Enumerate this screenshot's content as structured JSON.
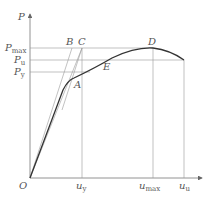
{
  "diagram": {
    "type": "load-displacement curve",
    "axes": {
      "y_label": "P",
      "x_origin_label": "O"
    },
    "y_levels": [
      {
        "id": "pmax",
        "base": "P",
        "sub": "max"
      },
      {
        "id": "pu",
        "base": "P",
        "sub": "u"
      },
      {
        "id": "py",
        "base": "P",
        "sub": "y"
      }
    ],
    "x_levels": [
      {
        "id": "uy",
        "base": "u",
        "sub": "y"
      },
      {
        "id": "umax",
        "base": "u",
        "sub": "max"
      },
      {
        "id": "uu",
        "base": "u",
        "sub": "u"
      }
    ],
    "points": {
      "A": "A",
      "B": "B",
      "C": "C",
      "D": "D",
      "E": "E"
    },
    "colors": {
      "curve": "#333333",
      "lines": "#888888",
      "text": "#555555"
    }
  }
}
